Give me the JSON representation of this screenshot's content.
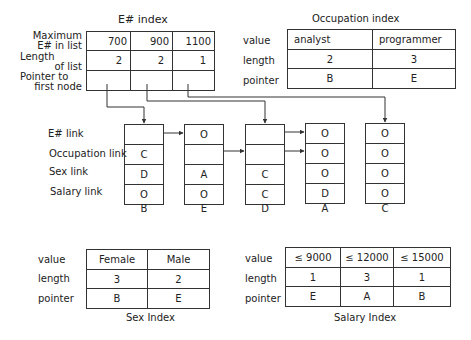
{
  "e_index": {
    "title": "E# index",
    "row_labels": [
      "Maximum E# in list",
      "Length of list",
      "Pointer to first node"
    ],
    "row_label_lines": [
      [
        "Maximum",
        "E# in list"
      ],
      [
        "Length",
        "of list"
      ],
      [
        "Pointer to",
        "first node"
      ]
    ],
    "columns": [
      {
        "max": "700",
        "length": "2",
        "pointer": "→B"
      },
      {
        "max": "900",
        "length": "2",
        "pointer": "→D"
      },
      {
        "max": "1100",
        "length": "1",
        "pointer": "→C"
      }
    ]
  },
  "occupation_index": {
    "title": "Occupation index",
    "row_labels": [
      "value",
      "length",
      "pointer"
    ],
    "columns": [
      {
        "value": "analyst",
        "length": "2",
        "pointer": "B"
      },
      {
        "value": "programmer",
        "length": "3",
        "pointer": "E"
      }
    ]
  },
  "nodes": {
    "field_labels": [
      "E# link",
      "Occupation link",
      "Sex link",
      "Salary link"
    ],
    "items": [
      {
        "name": "B",
        "e_link": "",
        "occupation_link": "C",
        "sex_link": "D",
        "salary_link": "O"
      },
      {
        "name": "E",
        "e_link": "O",
        "occupation_link": "",
        "sex_link": "A",
        "salary_link": "O"
      },
      {
        "name": "D",
        "e_link": "",
        "occupation_link": "",
        "sex_link": "C",
        "salary_link": "C"
      },
      {
        "name": "A",
        "e_link": "O",
        "occupation_link": "O",
        "sex_link": "O",
        "salary_link": "D"
      },
      {
        "name": "C",
        "e_link": "O",
        "occupation_link": "O",
        "sex_link": "O",
        "salary_link": "O"
      }
    ]
  },
  "sex_index": {
    "title": "Sex Index",
    "row_labels": [
      "value",
      "length",
      "pointer"
    ],
    "columns": [
      {
        "value": "Female",
        "length": "3",
        "pointer": "B"
      },
      {
        "value": "Male",
        "length": "2",
        "pointer": "E"
      }
    ]
  },
  "salary_index": {
    "title": "Salary Index",
    "row_labels": [
      "value",
      "length",
      "pointer"
    ],
    "columns": [
      {
        "value": "≤ 9000",
        "length": "1",
        "pointer": "E"
      },
      {
        "value": "≤ 12000",
        "length": "3",
        "pointer": "A"
      },
      {
        "value": "≤ 15000",
        "length": "1",
        "pointer": "B"
      }
    ]
  },
  "colors": {
    "line": "#333333",
    "text": "#222222",
    "background": "#ffffff"
  }
}
